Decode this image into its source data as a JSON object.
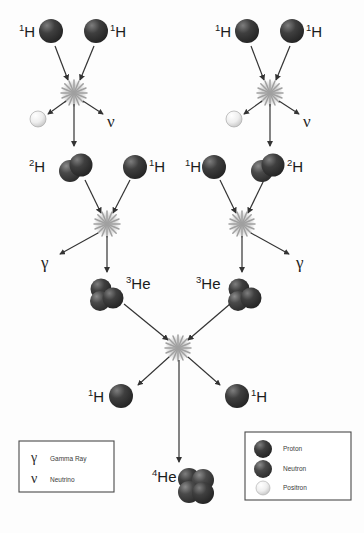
{
  "figure": {
    "background_color": "#fdfdfd"
  },
  "colors": {
    "proton_dark": "#2f2f2f",
    "proton_light": "#6e6e6e",
    "neutron_dark": "#3a3a3a",
    "neutron_light": "#7a7a7a",
    "positron_dark": "#cfcfcf",
    "positron_light": "#ffffff",
    "arrow": "#333333",
    "burst": "#9b9b9b",
    "text": "#1b1b1b",
    "legend_border": "#4a4a4a"
  },
  "branches": {
    "left": {
      "name": "left-branch",
      "reactants_top": [
        {
          "id": "left-h1-a",
          "label_sup": "1",
          "label_base": "H",
          "label_side": "left"
        },
        {
          "id": "left-h1-b",
          "label_sup": "1",
          "label_base": "H",
          "label_side": "right"
        }
      ],
      "fusion_1_products": [
        {
          "id": "left-positron",
          "type": "positron",
          "label": ""
        },
        {
          "id": "left-neutrino",
          "type": "neutrino",
          "label": "ν"
        },
        {
          "id": "left-deuterium",
          "label_sup": "2",
          "label_base": "H",
          "label_side": "left"
        }
      ],
      "second_reactant": {
        "id": "left-h1-c",
        "label_sup": "1",
        "label_base": "H",
        "label_side": "right"
      },
      "fusion_2_products": [
        {
          "id": "left-gamma",
          "type": "gamma",
          "label": "γ"
        },
        {
          "id": "left-he3",
          "label_sup": "3",
          "label_base": "He",
          "label_side": "right"
        }
      ]
    },
    "right": {
      "name": "right-branch",
      "reactants_top": [
        {
          "id": "right-h1-a",
          "label_sup": "1",
          "label_base": "H",
          "label_side": "left"
        },
        {
          "id": "right-h1-b",
          "label_sup": "1",
          "label_base": "H",
          "label_side": "right"
        }
      ],
      "fusion_1_products": [
        {
          "id": "right-positron",
          "type": "positron",
          "label": ""
        },
        {
          "id": "right-neutrino",
          "type": "neutrino",
          "label": "ν"
        },
        {
          "id": "right-deuterium",
          "label_sup": "2",
          "label_base": "H",
          "label_side": "right"
        }
      ],
      "second_reactant": {
        "id": "right-h1-c",
        "label_sup": "1",
        "label_base": "H",
        "label_side": "left"
      },
      "fusion_2_products": [
        {
          "id": "right-gamma",
          "type": "gamma",
          "label": "γ"
        },
        {
          "id": "right-he3",
          "label_sup": "3",
          "label_base": "He",
          "label_side": "left"
        }
      ]
    }
  },
  "final_fusion": {
    "name": "final-fusion",
    "products": [
      {
        "id": "final-h1-left",
        "label_sup": "1",
        "label_base": "H",
        "label_side": "left"
      },
      {
        "id": "final-h1-right",
        "label_sup": "1",
        "label_base": "H",
        "label_side": "right"
      },
      {
        "id": "final-he4",
        "label_sup": "4",
        "label_base": "He",
        "label_side": "left"
      }
    ]
  },
  "legend_particles": {
    "name": "particle-legend",
    "items": [
      {
        "label": "Proton",
        "type": "proton"
      },
      {
        "label": "Neutron",
        "type": "neutron"
      },
      {
        "label": "Positron",
        "type": "positron"
      }
    ]
  },
  "legend_symbols": {
    "name": "symbol-legend",
    "items": [
      {
        "symbol": "γ",
        "label": "Gamma Ray"
      },
      {
        "symbol": "ν",
        "label": "Neutrino"
      }
    ]
  },
  "footer_ghost": {
    "text": ""
  }
}
